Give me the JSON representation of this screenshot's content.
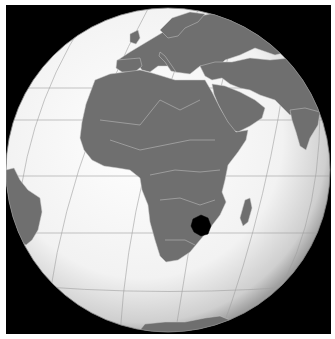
{
  "map": {
    "title": "Zimbabwe (orthographic projection)",
    "projection": "orthographic",
    "highlighted_country": "Zimbabwe",
    "colors": {
      "background": "#000000",
      "ocean_center": "#ffffff",
      "ocean_edge": "#bdbdbd",
      "land": "#6f6f6f",
      "borders": "#c8c8c8",
      "graticule": "#9a9a9a",
      "highlight": "#000000"
    },
    "visible_regions": [
      "Europe",
      "Africa",
      "Middle East",
      "Arabian Peninsula",
      "India",
      "Madagascar",
      "South America (east edge)",
      "Antarctica"
    ]
  }
}
